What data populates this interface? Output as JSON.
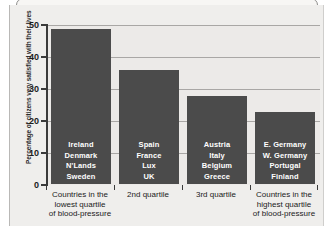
{
  "figure": {
    "ghost_header_text": ""
  },
  "chart_data": {
    "type": "bar",
    "title": "",
    "xlabel": "",
    "ylabel": "Percentage of citizens very satisfied with their lives",
    "ylim": [
      0,
      50
    ],
    "yticks": [
      0,
      10,
      20,
      30,
      40,
      50
    ],
    "ytick_labels": [
      "0",
      "10",
      "20",
      "30",
      "40",
      "50"
    ],
    "grid": true,
    "legend": "none",
    "bar_color": "#4b4b4b",
    "plot_background": "#eceae8",
    "categories": [
      "Countries in the lowest quartile of blood-pressure",
      "2nd quartile",
      "3rd quartile",
      "Countries in the highest quartile of blood-pressure"
    ],
    "category_label_lines": [
      [
        "Countries in the",
        "lowest quartile",
        "of blood-pressure"
      ],
      [
        "2nd quartile"
      ],
      [
        "3rd quartile"
      ],
      [
        "Countries in the",
        "highest quartile",
        "of blood-pressure"
      ]
    ],
    "values": [
      48.7,
      36.0,
      27.7,
      22.7
    ],
    "bar_country_labels": [
      [
        "Ireland",
        "Denmark",
        "N'Lands",
        "Sweden"
      ],
      [
        "Spain",
        "France",
        "Lux",
        "UK"
      ],
      [
        "Austria",
        "Italy",
        "Belgium",
        "Greece"
      ],
      [
        "E. Germany",
        "W. Germany",
        "Portugal",
        "Finland"
      ]
    ]
  }
}
